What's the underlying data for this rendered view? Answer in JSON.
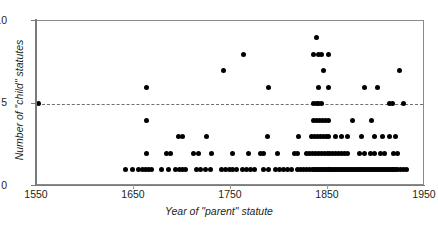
{
  "chart_data": {
    "type": "scatter",
    "title": "",
    "xlabel": "Year of \"parent\" statute",
    "ylabel": "Number of \"child\" statutes",
    "xlim": [
      1550,
      1950
    ],
    "ylim": [
      0,
      10
    ],
    "xticks": [
      1550,
      1650,
      1750,
      1850,
      1950
    ],
    "xticklabels": [
      "1550",
      "1650",
      "1750",
      "1850",
      "1950"
    ],
    "yticks": [
      0,
      5,
      10
    ],
    "yticklabels": [
      "0",
      "5",
      "10"
    ],
    "grid": false,
    "legend": null,
    "reference_lines": [
      {
        "axis": "y",
        "value": 5,
        "style": "dashed",
        "color": "#6f6f6f"
      }
    ],
    "marker": {
      "shape": "circle",
      "color": "#000000",
      "size": 5
    },
    "points": [
      [
        1552,
        5
      ],
      [
        1663,
        6
      ],
      [
        1663,
        4
      ],
      [
        1700,
        3
      ],
      [
        1763,
        8
      ],
      [
        1742,
        7
      ],
      [
        1789,
        6
      ],
      [
        1838,
        9
      ],
      [
        1835,
        8
      ],
      [
        1840,
        8
      ],
      [
        1843,
        8
      ],
      [
        1851,
        8
      ],
      [
        1845,
        7
      ],
      [
        1840,
        6
      ],
      [
        1851,
        6
      ],
      [
        1888,
        6
      ],
      [
        1901,
        6
      ],
      [
        1924,
        7
      ],
      [
        1835,
        5
      ],
      [
        1838,
        5
      ],
      [
        1840,
        5
      ],
      [
        1843,
        5
      ],
      [
        1913,
        5
      ],
      [
        1916,
        5
      ],
      [
        1928,
        5
      ],
      [
        1835,
        4
      ],
      [
        1838,
        4
      ],
      [
        1841,
        4
      ],
      [
        1844,
        4
      ],
      [
        1847,
        4
      ],
      [
        1850,
        4
      ],
      [
        1875,
        4
      ],
      [
        1895,
        4
      ],
      [
        1696,
        3
      ],
      [
        1725,
        3
      ],
      [
        1788,
        3
      ],
      [
        1820,
        3
      ],
      [
        1833,
        3
      ],
      [
        1836,
        3
      ],
      [
        1839,
        3
      ],
      [
        1842,
        3
      ],
      [
        1845,
        3
      ],
      [
        1848,
        3
      ],
      [
        1851,
        3
      ],
      [
        1858,
        3
      ],
      [
        1864,
        3
      ],
      [
        1870,
        3
      ],
      [
        1885,
        3
      ],
      [
        1898,
        3
      ],
      [
        1906,
        3
      ],
      [
        1913,
        3
      ],
      [
        1920,
        3
      ],
      [
        1663,
        2
      ],
      [
        1684,
        2
      ],
      [
        1688,
        2
      ],
      [
        1711,
        2
      ],
      [
        1717,
        2
      ],
      [
        1730,
        2
      ],
      [
        1752,
        2
      ],
      [
        1768,
        2
      ],
      [
        1780,
        2
      ],
      [
        1784,
        2
      ],
      [
        1798,
        2
      ],
      [
        1815,
        2
      ],
      [
        1819,
        2
      ],
      [
        1828,
        2
      ],
      [
        1831,
        2
      ],
      [
        1834,
        2
      ],
      [
        1837,
        2
      ],
      [
        1840,
        2
      ],
      [
        1843,
        2
      ],
      [
        1846,
        2
      ],
      [
        1849,
        2
      ],
      [
        1852,
        2
      ],
      [
        1855,
        2
      ],
      [
        1858,
        2
      ],
      [
        1861,
        2
      ],
      [
        1864,
        2
      ],
      [
        1867,
        2
      ],
      [
        1870,
        2
      ],
      [
        1882,
        2
      ],
      [
        1888,
        2
      ],
      [
        1894,
        2
      ],
      [
        1898,
        2
      ],
      [
        1904,
        2
      ],
      [
        1908,
        2
      ],
      [
        1918,
        2
      ],
      [
        1922,
        2
      ],
      [
        1641,
        1
      ],
      [
        1648,
        1
      ],
      [
        1655,
        1
      ],
      [
        1659,
        1
      ],
      [
        1662,
        1
      ],
      [
        1665,
        1
      ],
      [
        1668,
        1
      ],
      [
        1678,
        1
      ],
      [
        1686,
        1
      ],
      [
        1693,
        1
      ],
      [
        1697,
        1
      ],
      [
        1700,
        1
      ],
      [
        1703,
        1
      ],
      [
        1714,
        1
      ],
      [
        1719,
        1
      ],
      [
        1724,
        1
      ],
      [
        1729,
        1
      ],
      [
        1740,
        1
      ],
      [
        1744,
        1
      ],
      [
        1748,
        1
      ],
      [
        1752,
        1
      ],
      [
        1756,
        1
      ],
      [
        1762,
        1
      ],
      [
        1766,
        1
      ],
      [
        1770,
        1
      ],
      [
        1774,
        1
      ],
      [
        1784,
        1
      ],
      [
        1789,
        1
      ],
      [
        1796,
        1
      ],
      [
        1800,
        1
      ],
      [
        1804,
        1
      ],
      [
        1808,
        1
      ],
      [
        1812,
        1
      ],
      [
        1819,
        1
      ],
      [
        1822,
        1
      ],
      [
        1825,
        1
      ],
      [
        1828,
        1
      ],
      [
        1831,
        1
      ],
      [
        1834,
        1
      ],
      [
        1836,
        1
      ],
      [
        1838,
        1
      ],
      [
        1840,
        1
      ],
      [
        1842,
        1
      ],
      [
        1844,
        1
      ],
      [
        1846,
        1
      ],
      [
        1848,
        1
      ],
      [
        1850,
        1
      ],
      [
        1852,
        1
      ],
      [
        1854,
        1
      ],
      [
        1856,
        1
      ],
      [
        1858,
        1
      ],
      [
        1860,
        1
      ],
      [
        1862,
        1
      ],
      [
        1864,
        1
      ],
      [
        1866,
        1
      ],
      [
        1868,
        1
      ],
      [
        1870,
        1
      ],
      [
        1872,
        1
      ],
      [
        1874,
        1
      ],
      [
        1876,
        1
      ],
      [
        1878,
        1
      ],
      [
        1880,
        1
      ],
      [
        1882,
        1
      ],
      [
        1884,
        1
      ],
      [
        1886,
        1
      ],
      [
        1888,
        1
      ],
      [
        1890,
        1
      ],
      [
        1892,
        1
      ],
      [
        1894,
        1
      ],
      [
        1896,
        1
      ],
      [
        1898,
        1
      ],
      [
        1900,
        1
      ],
      [
        1902,
        1
      ],
      [
        1904,
        1
      ],
      [
        1906,
        1
      ],
      [
        1908,
        1
      ],
      [
        1910,
        1
      ],
      [
        1912,
        1
      ],
      [
        1914,
        1
      ],
      [
        1916,
        1
      ],
      [
        1918,
        1
      ],
      [
        1920,
        1
      ],
      [
        1922,
        1
      ],
      [
        1925,
        1
      ],
      [
        1928,
        1
      ],
      [
        1931,
        1
      ]
    ]
  }
}
